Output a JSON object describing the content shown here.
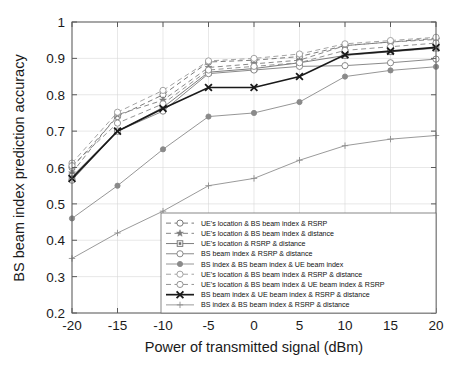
{
  "chart_data": {
    "type": "line",
    "title": "",
    "xlabel": "Power of transmitted signal (dBm)",
    "ylabel": "BS beam index prediction accuracy",
    "x": [
      -20,
      -15,
      -10,
      -5,
      0,
      5,
      10,
      15,
      20
    ],
    "xlim": [
      -20,
      20
    ],
    "ylim": [
      0.2,
      1
    ],
    "xticks": [
      "-20",
      "-15",
      "-10",
      "-5",
      "0",
      "5",
      "10",
      "15",
      "20"
    ],
    "yticks": [
      "0.2",
      "0.3",
      "0.4",
      "0.5",
      "0.6",
      "0.7",
      "0.8",
      "0.9",
      "1"
    ],
    "grid": true,
    "legend_position": "lower right",
    "series": [
      {
        "name": "UE's location & BS beam index & RSRP",
        "values": [
          0.6,
          0.74,
          0.8,
          0.89,
          0.895,
          0.905,
          0.935,
          0.945,
          0.955
        ],
        "style": "dashed",
        "marker": "circle-open",
        "color": "#6b6b6b"
      },
      {
        "name": "UE's location & BS beam index & distance",
        "values": [
          0.585,
          0.745,
          0.785,
          0.875,
          0.885,
          0.895,
          0.935,
          0.945,
          0.952
        ],
        "style": "dashed",
        "marker": "star",
        "color": "#7a7a7a"
      },
      {
        "name": "UE's location & RSRP & distance",
        "values": [
          0.575,
          0.7,
          0.765,
          0.862,
          0.872,
          0.888,
          0.908,
          0.918,
          0.928
        ],
        "style": "solid",
        "marker": "square",
        "color": "#6f6f6f"
      },
      {
        "name": "BS beam index & RSRP & distance",
        "values": [
          0.565,
          0.7,
          0.755,
          0.858,
          0.868,
          0.878,
          0.88,
          0.888,
          0.898
        ],
        "style": "solid",
        "marker": "circle-open",
        "color": "#7d7d7d"
      },
      {
        "name": "BS index & BS beam index & UE beam index",
        "values": [
          0.46,
          0.55,
          0.65,
          0.74,
          0.75,
          0.78,
          0.85,
          0.867,
          0.877
        ],
        "style": "solid",
        "marker": "circle-filled",
        "color": "#8a8a8a"
      },
      {
        "name": "UE's location & BS beam index & RSRP & distance",
        "values": [
          0.612,
          0.752,
          0.812,
          0.893,
          0.9,
          0.912,
          0.94,
          0.949,
          0.958
        ],
        "style": "dashed",
        "marker": "circle-open-light",
        "color": "#9a9a9a"
      },
      {
        "name": "UE's location & BS beam index & UE beam index & RSRP",
        "values": [
          0.605,
          0.722,
          0.775,
          0.868,
          0.878,
          0.888,
          0.922,
          0.932,
          0.942
        ],
        "style": "dashed",
        "marker": "circle-open",
        "color": "#888888"
      },
      {
        "name": "BS beam index & UE beam index & RSRP & distance",
        "values": [
          0.57,
          0.7,
          0.762,
          0.82,
          0.82,
          0.85,
          0.91,
          0.92,
          0.93
        ],
        "style": "solid-bold",
        "marker": "x-bold",
        "color": "#1a1a1a"
      },
      {
        "name": "BS index & BS beam index & RSRP & distance",
        "values": [
          0.35,
          0.42,
          0.48,
          0.55,
          0.57,
          0.62,
          0.66,
          0.678,
          0.688
        ],
        "style": "solid",
        "marker": "plus",
        "color": "#8f8f8f"
      }
    ]
  }
}
